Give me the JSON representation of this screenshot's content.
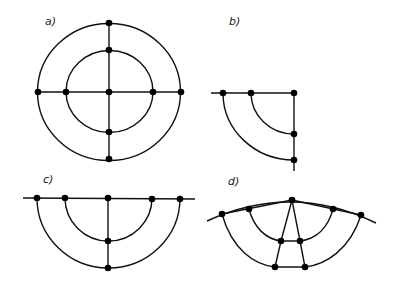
{
  "figure": {
    "background": "#ffffff",
    "ink_color": "#111111",
    "panels": [
      {
        "id": "a",
        "label": "a)",
        "description": "Two concentric circles with horizontal and vertical diameters; nodes at intersections and center",
        "label_pos": [
          45,
          25
        ],
        "center": [
          109,
          92
        ],
        "outer_radius": [
          71,
          69
        ],
        "inner_radius": [
          43,
          41
        ],
        "nodes": [
          [
            109,
            23
          ],
          [
            109,
            51
          ],
          [
            38,
            92
          ],
          [
            66,
            92
          ],
          [
            109,
            92
          ],
          [
            152,
            92
          ],
          [
            181,
            92
          ],
          [
            109,
            133
          ],
          [
            109,
            160
          ]
        ]
      },
      {
        "id": "b",
        "label": "b)",
        "description": "Quarter section: two concentric quarter arcs with horizontal and vertical edges",
        "label_pos": [
          229,
          25
        ],
        "corner": [
          294,
          93
        ],
        "outer_radius": 71,
        "inner_radius": 43,
        "nodes": [
          [
            223,
            93
          ],
          [
            251,
            93
          ],
          [
            294,
            93
          ],
          [
            294,
            134
          ],
          [
            294,
            161
          ]
        ]
      },
      {
        "id": "c",
        "label": "c)",
        "description": "Half section: two concentric half-circle arcs below a horizontal line with a vertical symmetry line",
        "label_pos": [
          43,
          183
        ],
        "center": [
          108,
          198
        ],
        "outer_radius": 71,
        "inner_radius": 43,
        "nodes": [
          [
            37,
            198
          ],
          [
            65,
            198
          ],
          [
            108,
            198
          ],
          [
            152,
            198
          ],
          [
            180,
            198
          ],
          [
            108,
            241
          ],
          [
            108,
            268
          ]
        ]
      },
      {
        "id": "d",
        "label": "d)",
        "description": "Distorted half section with curved top boundary, chords to apex, and split central members",
        "label_pos": [
          228,
          185
        ],
        "nodes": [
          [
            292,
            200
          ],
          [
            222,
            214
          ],
          [
            249,
            209
          ],
          [
            333,
            209
          ],
          [
            361,
            215
          ],
          [
            281,
            241
          ],
          [
            300,
            241
          ],
          [
            275,
            267
          ],
          [
            305,
            267
          ]
        ]
      }
    ]
  }
}
